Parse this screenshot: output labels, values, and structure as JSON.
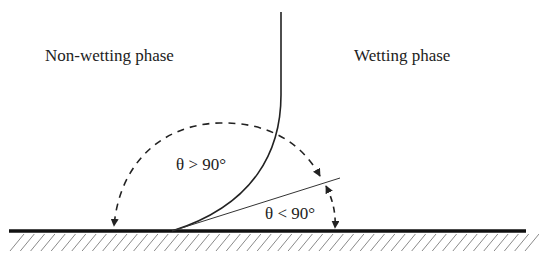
{
  "diagram": {
    "labels": {
      "non_wetting": "Non-wetting phase",
      "wetting": "Wetting phase",
      "angle_obtuse": "θ > 90°",
      "angle_acute": "θ < 90°"
    },
    "colors": {
      "ink": "#222222",
      "hatch": "#8a8a8a",
      "background": "#ffffff"
    },
    "elements": [
      "solid surface (thick baseline with diagonal hatching)",
      "fluid interface curve (vertical, bending to meet surface)",
      "tangent line at contact point",
      "dashed arc with arrows indicating obtuse contact angle",
      "short dashed arc with arrows indicating acute contact angle"
    ]
  }
}
